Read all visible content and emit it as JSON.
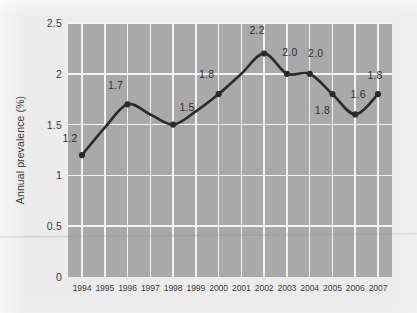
{
  "chart_data": {
    "type": "line",
    "title": "",
    "subtitle": "",
    "xlabel": "",
    "ylabel": "Annual prevalence (%)",
    "x": [
      "1994",
      "1995",
      "1996",
      "1997",
      "1998",
      "1999",
      "2000",
      "2001",
      "2002",
      "2003",
      "2004",
      "2005",
      "2006",
      "2007"
    ],
    "categories": [
      "1994",
      "1995",
      "1996",
      "1997",
      "1998",
      "1999",
      "2000",
      "2001",
      "2002",
      "2003",
      "2004",
      "2005",
      "2006",
      "2007"
    ],
    "values": [
      1.2,
      1.47,
      1.7,
      1.6,
      1.5,
      1.63,
      1.8,
      2.0,
      2.2,
      2.0,
      2.0,
      1.8,
      1.6,
      1.8
    ],
    "series": [
      {
        "name": "Annual prevalence",
        "values": [
          1.2,
          1.47,
          1.7,
          1.6,
          1.5,
          1.63,
          1.8,
          2.0,
          2.2,
          2.0,
          2.0,
          1.8,
          1.6,
          1.8
        ]
      }
    ],
    "ylim": [
      0,
      2.5
    ],
    "yticks": [
      "0",
      "0.5",
      "1",
      "1.5",
      "2",
      "2.5"
    ],
    "ytick_values": [
      0,
      0.5,
      1,
      1.5,
      2,
      2.5
    ],
    "grid": "both",
    "legend": "none",
    "line_color": "#2b2b2b",
    "marker_color": "#2b2b2b",
    "plot_background": "#a9a9a9",
    "gridline_color": "#f2f2f2",
    "page_background": "#ececec",
    "markers": [
      {
        "year": "1994",
        "value": 1.2,
        "label": "1.2",
        "label_dx": -12,
        "label_dy": -17
      },
      {
        "year": "1996",
        "value": 1.7,
        "label": "1.7",
        "label_dx": -12,
        "label_dy": -19
      },
      {
        "year": "1998",
        "value": 1.5,
        "label": "1.5",
        "label_dx": 14,
        "label_dy": -18
      },
      {
        "year": "2000",
        "value": 1.8,
        "label": "1.8",
        "label_dx": -12,
        "label_dy": -20
      },
      {
        "year": "2002",
        "value": 2.2,
        "label": "2.2",
        "label_dx": -7,
        "label_dy": -23
      },
      {
        "year": "2003",
        "value": 2.0,
        "label": "2.0",
        "label_dx": 3,
        "label_dy": -22
      },
      {
        "year": "2004",
        "value": 2.0,
        "label": "2.0",
        "label_dx": 6,
        "label_dy": -21
      },
      {
        "year": "2005",
        "value": 1.8,
        "label": "1.8",
        "label_dx": -10,
        "label_dy": 16
      },
      {
        "year": "2006",
        "value": 1.6,
        "label": "1.6",
        "label_dx": 3,
        "label_dy": -20
      },
      {
        "year": "2007",
        "value": 1.8,
        "label": "1.8",
        "label_dx": -3,
        "label_dy": -19
      }
    ]
  }
}
